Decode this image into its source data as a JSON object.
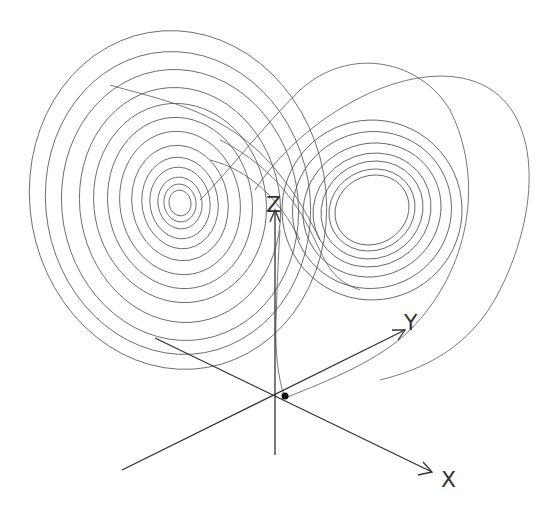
{
  "figure": {
    "axes": {
      "x": {
        "label": "X"
      },
      "y": {
        "label": "Y"
      },
      "z": {
        "label": "Z"
      }
    },
    "origin_marker": "initial-point",
    "colors": {
      "trajectory": "#555555",
      "axes": "#333333",
      "background": "#ffffff"
    }
  }
}
